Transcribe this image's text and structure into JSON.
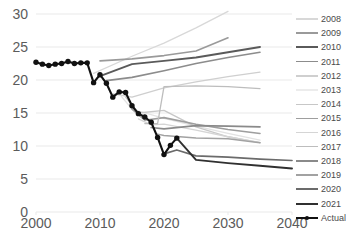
{
  "chart_data": {
    "type": "line",
    "title": "",
    "xlabel": "",
    "ylabel": "",
    "xlim": [
      2000,
      2040
    ],
    "ylim": [
      0,
      30
    ],
    "grid": true,
    "x_ticks": [
      "2000",
      "2010",
      "2020",
      "2030",
      "2040"
    ],
    "y_ticks": [
      "0",
      "5",
      "10",
      "15",
      "20",
      "25",
      "30"
    ],
    "legend_position": "right",
    "series": [
      {
        "name": "2008",
        "color": "#d8d8d8",
        "width": 1.3,
        "x": [
          2009,
          2015,
          2020,
          2025,
          2030
        ],
        "values": [
          21.0,
          23.6,
          25.6,
          27.9,
          30.4
        ]
      },
      {
        "name": "2009",
        "color": "#9a9a9a",
        "width": 1.6,
        "x": [
          2010,
          2015,
          2020,
          2025,
          2030
        ],
        "values": [
          22.9,
          23.2,
          23.7,
          24.4,
          26.4
        ]
      },
      {
        "name": "2010",
        "color": "#5a5a5a",
        "width": 1.9,
        "x": [
          2010,
          2015,
          2020,
          2025,
          2030,
          2035
        ],
        "values": [
          20.6,
          22.4,
          22.9,
          23.4,
          24.2,
          25.0
        ]
      },
      {
        "name": "2011",
        "color": "#8c8c8c",
        "width": 1.6,
        "x": [
          2011,
          2015,
          2020,
          2025,
          2030,
          2035
        ],
        "values": [
          19.9,
          20.4,
          21.4,
          22.5,
          23.4,
          24.2
        ]
      },
      {
        "name": "2012",
        "color": "#cfcfcf",
        "width": 1.3,
        "x": [
          2012,
          2015,
          2020,
          2025,
          2030,
          2035
        ],
        "values": [
          17.9,
          17.4,
          18.8,
          19.7,
          20.5,
          21.2
        ]
      },
      {
        "name": "2013",
        "color": "#e2e2e2",
        "width": 1.3,
        "x": [
          2013,
          2015,
          2020,
          2025,
          2030,
          2035
        ],
        "values": [
          17.9,
          15.6,
          14.2,
          13.0,
          11.9,
          10.9
        ]
      },
      {
        "name": "2014",
        "color": "#c7c7c7",
        "width": 1.3,
        "x": [
          2014,
          2016,
          2020,
          2025,
          2030,
          2035
        ],
        "values": [
          17.4,
          15.0,
          15.4,
          12.9,
          11.4,
          10.5
        ]
      },
      {
        "name": "2015",
        "color": "#9e9e9e",
        "width": 1.6,
        "x": [
          2015,
          2017,
          2020,
          2025,
          2030,
          2035
        ],
        "values": [
          15.6,
          13.9,
          14.3,
          13.3,
          12.5,
          11.9
        ]
      },
      {
        "name": "2016",
        "color": "#d5d5d5",
        "width": 1.3,
        "x": [
          2016,
          2018,
          2020,
          2025,
          2030,
          2035
        ],
        "values": [
          14.1,
          13.2,
          13.3,
          12.4,
          11.4,
          10.5
        ]
      },
      {
        "name": "2017",
        "color": "#bdbdbd",
        "width": 1.3,
        "x": [
          2017,
          2019,
          2020,
          2025,
          2030,
          2035
        ],
        "values": [
          13.4,
          13.4,
          19.0,
          19.1,
          19.0,
          18.7
        ]
      },
      {
        "name": "2018",
        "color": "#8a8a8a",
        "width": 1.7,
        "x": [
          2018,
          2020,
          2025,
          2030,
          2035
        ],
        "values": [
          12.8,
          12.6,
          13.1,
          13.0,
          12.9
        ]
      },
      {
        "name": "2019",
        "color": "#a2a2a2",
        "width": 1.5,
        "x": [
          2019,
          2020,
          2025,
          2030,
          2035
        ],
        "values": [
          11.8,
          11.6,
          11.2,
          11.1,
          10.5
        ]
      },
      {
        "name": "2020",
        "color": "#6b6b6b",
        "width": 1.7,
        "x": [
          2020,
          2022,
          2025,
          2030,
          2035,
          2040
        ],
        "values": [
          8.8,
          9.4,
          8.5,
          8.3,
          8.0,
          7.8
        ]
      },
      {
        "name": "2021",
        "color": "#303030",
        "width": 1.9,
        "x": [
          2022,
          2025,
          2030,
          2035,
          2040
        ],
        "values": [
          11.2,
          7.9,
          7.4,
          7.0,
          6.6
        ]
      },
      {
        "name": "Actual",
        "color": "#111111",
        "width": 2.1,
        "marker": "circle",
        "x": [
          2000,
          2001,
          2002,
          2003,
          2004,
          2005,
          2006,
          2007,
          2008,
          2009,
          2010,
          2011,
          2012,
          2013,
          2014,
          2015,
          2016,
          2017,
          2018,
          2019,
          2020,
          2021,
          2022
        ],
        "values": [
          22.7,
          22.4,
          22.2,
          22.4,
          22.5,
          22.8,
          22.5,
          22.6,
          22.6,
          19.6,
          20.8,
          19.5,
          17.4,
          18.2,
          18.1,
          16.1,
          14.9,
          14.4,
          13.6,
          11.3,
          8.7,
          10.1,
          11.2
        ]
      }
    ]
  },
  "axes": {
    "y_labels": [
      "30",
      "25",
      "20",
      "15",
      "10",
      "5",
      "0"
    ],
    "x_labels": [
      "2000",
      "2010",
      "2020",
      "2030",
      "2040"
    ]
  },
  "legend": {
    "items": [
      {
        "label": "2008",
        "color": "#d8d8d8",
        "width": 1.3,
        "marker": false
      },
      {
        "label": "2009",
        "color": "#9a9a9a",
        "width": 1.6,
        "marker": false
      },
      {
        "label": "2010",
        "color": "#5a5a5a",
        "width": 2.0,
        "marker": false
      },
      {
        "label": "2011",
        "color": "#8c8c8c",
        "width": 1.6,
        "marker": false
      },
      {
        "label": "2012",
        "color": "#cfcfcf",
        "width": 1.3,
        "marker": false
      },
      {
        "label": "2013",
        "color": "#ececec",
        "width": 1.2,
        "marker": false
      },
      {
        "label": "2014",
        "color": "#c7c7c7",
        "width": 1.3,
        "marker": false
      },
      {
        "label": "2015",
        "color": "#9e9e9e",
        "width": 1.6,
        "marker": false
      },
      {
        "label": "2016",
        "color": "#d5d5d5",
        "width": 1.3,
        "marker": false
      },
      {
        "label": "2017",
        "color": "#bdbdbd",
        "width": 1.3,
        "marker": false
      },
      {
        "label": "2018",
        "color": "#8a8a8a",
        "width": 1.8,
        "marker": false
      },
      {
        "label": "2019",
        "color": "#a2a2a2",
        "width": 1.5,
        "marker": false
      },
      {
        "label": "2020",
        "color": "#6b6b6b",
        "width": 1.8,
        "marker": false
      },
      {
        "label": "2021",
        "color": "#303030",
        "width": 2.0,
        "marker": false
      },
      {
        "label": "Actual",
        "color": "#111111",
        "width": 2.0,
        "marker": true
      }
    ]
  },
  "colors": {
    "gridline": "#e9e9e9",
    "axis_text": "#5b5b5b",
    "legend_text": "#4a4a4a",
    "background": "#ffffff"
  }
}
